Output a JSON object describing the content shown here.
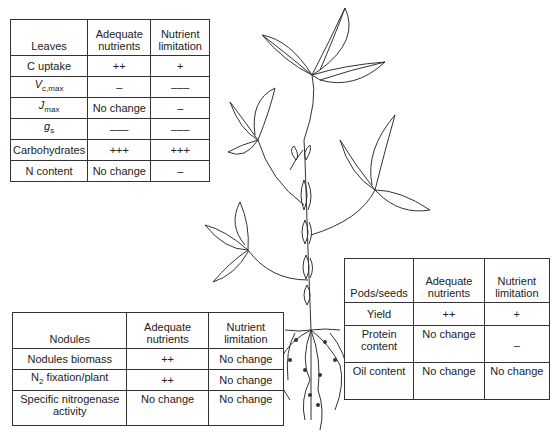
{
  "leaves_table": {
    "header": [
      "Leaves",
      "Adequate nutrients",
      "Nutrient limitation"
    ],
    "rows": [
      {
        "label": "C uptake",
        "adequate": "++",
        "limitation": "+"
      },
      {
        "label_main": "V",
        "label_sub": "c,max",
        "adequate": "–",
        "limitation": "–––"
      },
      {
        "label_main": "J",
        "label_sub": "max",
        "adequate": "No change",
        "limitation": "–"
      },
      {
        "label_main": "g",
        "label_sub": "s",
        "adequate": "–––",
        "limitation": "–––"
      },
      {
        "label": "Carbohydrates",
        "adequate": "+++",
        "limitation": "+++"
      },
      {
        "label": "N content",
        "adequate": "No change",
        "limitation": "–"
      }
    ]
  },
  "pods_table": {
    "header": [
      "Pods/seeds",
      "Adequate nutrients",
      "Nutrient limitation"
    ],
    "rows": [
      {
        "label": "Yield",
        "adequate": "++",
        "limitation": "+"
      },
      {
        "label": "Protein content",
        "adequate": "No change",
        "limitation": "–"
      },
      {
        "label": "Oil content",
        "adequate": "No change",
        "limitation": "No change"
      }
    ]
  },
  "nodules_table": {
    "header": [
      "Nodules",
      "Adequate nutrients",
      "Nutrient limitation"
    ],
    "rows": [
      {
        "label": "Nodules biomass",
        "adequate": "++",
        "limitation": "No change"
      },
      {
        "label_main": "N",
        "label_sub": "2",
        "label_rest": " fixation/plant",
        "adequate": "++",
        "limitation": "No change"
      },
      {
        "label": "Specific nitrogenase activity",
        "adequate": "No change",
        "limitation": "No change"
      }
    ]
  },
  "illustration": {
    "subject": "soybean plant with leaves, pods, stem and nodulated roots",
    "line_color": "#333333"
  }
}
